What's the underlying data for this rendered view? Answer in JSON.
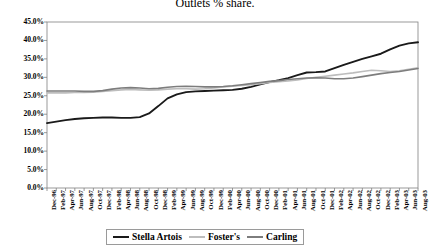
{
  "chart_data": {
    "type": "line",
    "title": "Outlets % share.",
    "xlabel": "",
    "ylabel": "",
    "ylim": [
      0,
      45
    ],
    "ytick_labels": [
      "0.0%",
      "5.0%",
      "10.0%",
      "15.0%",
      "20.0%",
      "25.0%",
      "30.0%",
      "35.0%",
      "40.0%",
      "45.0%"
    ],
    "ytick_values": [
      0,
      5,
      10,
      15,
      20,
      25,
      30,
      35,
      40,
      45
    ],
    "grid": false,
    "legend_position": "bottom-center",
    "categories": [
      "Dec-96",
      "Feb-97",
      "Apr-97",
      "Jun-97",
      "Aug-97",
      "Oct-97",
      "Dec-97",
      "Feb-98",
      "Apr-98",
      "Jun-98",
      "Aug-98",
      "Oct-98",
      "Dec-98",
      "Feb-99",
      "Apr-99",
      "Jun-99",
      "Aug-99",
      "Oct-99",
      "Dec-99",
      "Feb-00",
      "Apr-00",
      "Jun-00",
      "Aug-00",
      "Oct-00",
      "Dec-00",
      "Feb-01",
      "Apr-01",
      "Jun-01",
      "Aug-01",
      "Oct-01",
      "Dec-01",
      "Feb-02",
      "Apr-02",
      "Jun-02",
      "Aug-02",
      "Oct-02",
      "Dec-02",
      "Feb-03",
      "Apr-03",
      "Jun-03",
      "Aug-03"
    ],
    "series": [
      {
        "name": "Stella Artois",
        "color": "#1a1a1a",
        "width": 1.9,
        "values": [
          17.6,
          18.0,
          18.4,
          18.7,
          18.9,
          19.0,
          19.1,
          19.1,
          19.0,
          19.0,
          19.2,
          20.2,
          22.2,
          24.3,
          25.4,
          26.0,
          26.2,
          26.3,
          26.4,
          26.5,
          26.6,
          26.9,
          27.4,
          28.1,
          28.7,
          29.2,
          29.8,
          30.6,
          31.3,
          31.4,
          31.6,
          32.5,
          33.4,
          34.2,
          35.0,
          35.7,
          36.4,
          37.6,
          38.6,
          39.2,
          39.5
        ]
      },
      {
        "name": "Foster's",
        "color": "#bdbdbd",
        "width": 1.6,
        "values": [
          25.8,
          25.8,
          25.8,
          25.9,
          25.9,
          26.0,
          26.2,
          26.4,
          26.6,
          26.7,
          26.6,
          26.5,
          26.6,
          26.8,
          26.9,
          26.9,
          26.8,
          26.9,
          27.1,
          27.4,
          27.6,
          27.8,
          28.0,
          28.3,
          28.6,
          28.8,
          29.0,
          29.3,
          29.7,
          30.0,
          30.3,
          30.6,
          30.9,
          31.2,
          31.6,
          31.9,
          31.8,
          31.6,
          31.8,
          32.2,
          32.6
        ]
      },
      {
        "name": "Carling",
        "color": "#7d7d7d",
        "width": 1.6,
        "values": [
          26.3,
          26.3,
          26.3,
          26.3,
          26.2,
          26.2,
          26.4,
          26.8,
          27.1,
          27.2,
          27.1,
          26.9,
          27.0,
          27.3,
          27.5,
          27.6,
          27.5,
          27.4,
          27.4,
          27.5,
          27.7,
          28.0,
          28.3,
          28.6,
          28.9,
          29.1,
          29.4,
          29.6,
          29.8,
          29.9,
          29.8,
          29.6,
          29.6,
          29.8,
          30.2,
          30.6,
          31.0,
          31.3,
          31.6,
          32.0,
          32.4
        ]
      }
    ],
    "legend": [
      {
        "label": "Stella Artois",
        "color": "#1a1a1a",
        "width": 2
      },
      {
        "label": "Foster's",
        "color": "#bdbdbd",
        "width": 2
      },
      {
        "label": "Carling",
        "color": "#7d7d7d",
        "width": 2
      }
    ],
    "axis_color": "#808080",
    "plot_area": {
      "left": 47,
      "right": 418,
      "top": 22,
      "bottom": 188
    }
  }
}
